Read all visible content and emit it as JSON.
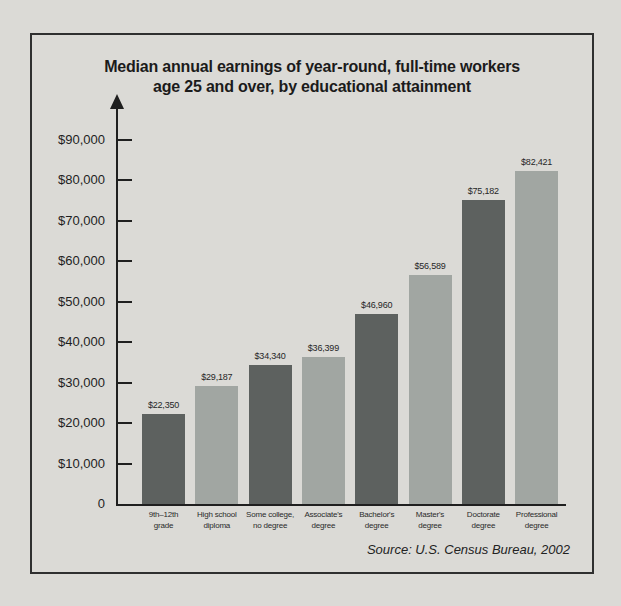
{
  "page": {
    "background": "#dbdad6",
    "frame_border_color": "#2f2f2f"
  },
  "header": {
    "title_line1": "Median annual earnings of year-round, full-time workers",
    "title_line2": "age 25 and over, by educational attainment"
  },
  "source_note": "Source: U.S. Census Bureau, 2002",
  "chart_data": {
    "type": "bar",
    "title": "Median annual earnings of year-round, full-time workers age 25 and over, by educational attainment",
    "xlabel": "",
    "ylabel": "",
    "ylim": [
      0,
      90000
    ],
    "grid": false,
    "legend": false,
    "categories": [
      "9th–12th grade",
      "High school diploma",
      "Some college, no degree",
      "Associate's degree",
      "Bachelor's degree",
      "Master's degree",
      "Doctorate degree",
      "Professional degree"
    ],
    "category_label_lines": [
      [
        "9th–12th",
        "grade"
      ],
      [
        "High school",
        "diploma"
      ],
      [
        "Some college,",
        "no degree"
      ],
      [
        "Associate's",
        "degree"
      ],
      [
        "Bachelor's",
        "degree"
      ],
      [
        "Master's",
        "degree"
      ],
      [
        "Doctorate",
        "degree"
      ],
      [
        "Professional",
        "degree"
      ]
    ],
    "values": [
      22350,
      29187,
      34340,
      36399,
      46960,
      56589,
      75182,
      82421
    ],
    "value_labels": [
      "$22,350",
      "$29,187",
      "$34,340",
      "$36,399",
      "$46,960",
      "$56,589",
      "$75,182",
      "$82,421"
    ],
    "y_ticks": [
      {
        "label": "$90,000",
        "value": 90000
      },
      {
        "label": "$80,000",
        "value": 80000
      },
      {
        "label": "$70,000",
        "value": 70000
      },
      {
        "label": "$60,000",
        "value": 60000
      },
      {
        "label": "$50,000",
        "value": 50000
      },
      {
        "label": "$40,000",
        "value": 40000
      },
      {
        "label": "$30,000",
        "value": 30000
      },
      {
        "label": "$20,000",
        "value": 20000
      },
      {
        "label": "$10,000",
        "value": 10000
      },
      {
        "label": "0",
        "value": 0
      }
    ],
    "bar_colors_alternating": [
      "#5d615f",
      "#a1a6a2"
    ],
    "source": "Source: U.S. Census Bureau, 2002"
  }
}
